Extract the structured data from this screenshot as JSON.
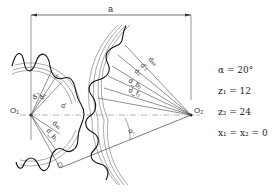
{
  "diagram": {
    "labels": {
      "center_distance": "a",
      "center_1": "O₁",
      "center_2": "O₂",
      "pitch_diameter_1": "d'₁",
      "diameter_1b": "d₁",
      "addendum_diameter_1": "dₐ₁",
      "base_diameter_1": "d_b₁",
      "tip_label_2a": "dₐ₂",
      "tip_label_2b": "d'₂",
      "diameter_2": "d₂",
      "base_diameter_2": "d_b₂",
      "root_diameter_2": "d_f₂",
      "pressure_angle_1": "α'",
      "pressure_angle_2": "α'"
    }
  },
  "parameters": [
    "α = 20°",
    "z₁ = 12",
    "z₂ = 24",
    "x₁ = x₂ = 0"
  ]
}
